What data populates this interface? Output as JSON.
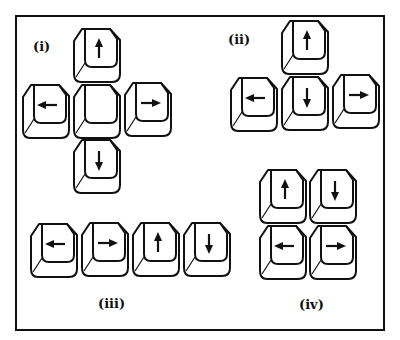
{
  "figure": {
    "groups": [
      {
        "id": "i",
        "label": "(i)",
        "layout": "cross",
        "keys": [
          {
            "arrow": "up",
            "x": 72,
            "y": 27
          },
          {
            "arrow": "left",
            "x": 21,
            "y": 83
          },
          {
            "arrow": "none",
            "x": 72,
            "y": 83
          },
          {
            "arrow": "right",
            "x": 123,
            "y": 81
          },
          {
            "arrow": "down",
            "x": 72,
            "y": 138
          }
        ],
        "label_pos": {
          "x": 33,
          "y": 39
        }
      },
      {
        "id": "ii",
        "label": "(ii)",
        "layout": "inverted-T",
        "keys": [
          {
            "arrow": "up",
            "x": 280,
            "y": 19
          },
          {
            "arrow": "left",
            "x": 229,
            "y": 76
          },
          {
            "arrow": "down",
            "x": 280,
            "y": 75
          },
          {
            "arrow": "right",
            "x": 331,
            "y": 73
          }
        ],
        "label_pos": {
          "x": 228,
          "y": 32
        }
      },
      {
        "id": "iii",
        "label": "(iii)",
        "layout": "row",
        "keys": [
          {
            "arrow": "left",
            "x": 29,
            "y": 222
          },
          {
            "arrow": "right",
            "x": 80,
            "y": 221
          },
          {
            "arrow": "up",
            "x": 131,
            "y": 221
          },
          {
            "arrow": "down",
            "x": 182,
            "y": 221
          }
        ],
        "label_pos": {
          "x": 98,
          "y": 296
        }
      },
      {
        "id": "iv",
        "label": "(iv)",
        "layout": "2x2-grid",
        "keys": [
          {
            "arrow": "up",
            "x": 258,
            "y": 168
          },
          {
            "arrow": "down",
            "x": 308,
            "y": 168
          },
          {
            "arrow": "left",
            "x": 258,
            "y": 224
          },
          {
            "arrow": "right",
            "x": 308,
            "y": 224
          }
        ],
        "label_pos": {
          "x": 299,
          "y": 297
        }
      }
    ]
  },
  "colors": {
    "stroke": "#111111",
    "background": "#ffffff"
  }
}
